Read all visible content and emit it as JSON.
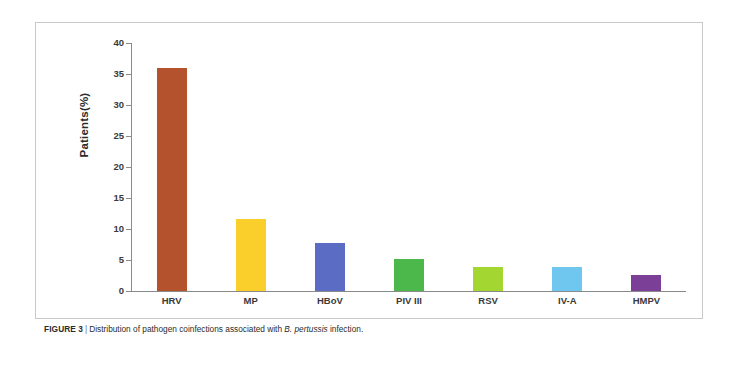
{
  "chart_data": {
    "type": "bar",
    "title": "",
    "xlabel": "",
    "ylabel": "Patients(%)",
    "ylim": [
      0,
      40
    ],
    "ytick_step": 5,
    "grid": false,
    "legend": "none",
    "categories": [
      "HRV",
      "MP",
      "HBoV",
      "PIV III",
      "RSV",
      "IV-A",
      "HMPV"
    ],
    "values": [
      36,
      11.6,
      7.7,
      5.2,
      3.9,
      3.9,
      2.6
    ],
    "ytick_labels": [
      "40",
      "35",
      "30",
      "25",
      "20",
      "15",
      "10",
      "5",
      "0"
    ],
    "ytick_values": [
      40,
      35,
      30,
      25,
      20,
      15,
      10,
      5,
      0
    ],
    "bar_colors": [
      "#b4522e",
      "#fbcf2b",
      "#5b6cc4",
      "#4cb84c",
      "#a4d632",
      "#6fc7f0",
      "#7b3f98"
    ],
    "bars": [
      {
        "category": "HRV",
        "value": 36,
        "color": "#b4522e"
      },
      {
        "category": "MP",
        "value": 11.6,
        "color": "#fbcf2b"
      },
      {
        "category": "HBoV",
        "value": 7.7,
        "color": "#5b6cc4"
      },
      {
        "category": "PIV III",
        "value": 5.2,
        "color": "#4cb84c"
      },
      {
        "category": "RSV",
        "value": 3.9,
        "color": "#a4d632"
      },
      {
        "category": "IV-A",
        "value": 3.9,
        "color": "#6fc7f0"
      },
      {
        "category": "HMPV",
        "value": 2.6,
        "color": "#7b3f98"
      }
    ]
  },
  "caption": {
    "figure_number": "FIGURE 3",
    "separator": "|",
    "text_before_italic": "Distribution of pathogen coinfections associated with ",
    "italic_text": "B. pertussis",
    "text_after_italic": " infection."
  },
  "colors": {
    "axis": "#8a8a8a",
    "panel_border": "#c9c9c9",
    "text": "#2b2b2b",
    "background": "#ffffff"
  }
}
